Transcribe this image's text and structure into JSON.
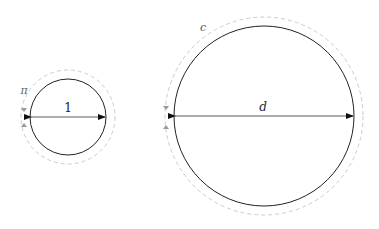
{
  "small_circle": {
    "cx": 68,
    "cy": 117,
    "r": 38,
    "dashed_r": 47,
    "diameter_label": "1",
    "circumference_label": "π"
  },
  "large_circle": {
    "cx": 264,
    "cy": 116,
    "r": 90,
    "dashed_r": 99,
    "diameter_label": "d",
    "circumference_label": "c"
  },
  "colors": {
    "stroke": "#222222",
    "dashed": "#c8c8c8",
    "arrow_small": "#999999"
  }
}
